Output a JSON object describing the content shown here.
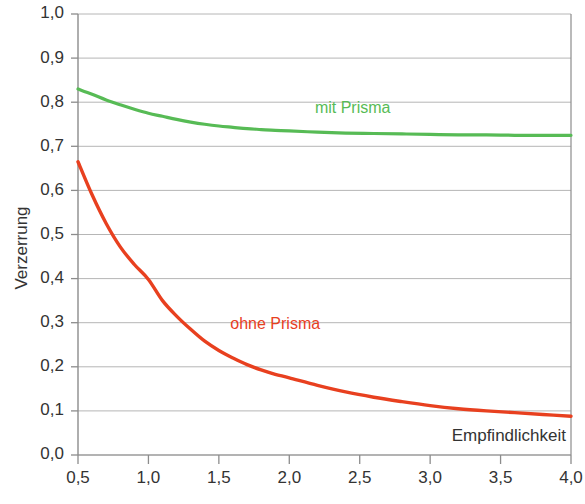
{
  "chart_data": {
    "type": "line",
    "title": "",
    "subtitle": "",
    "xlabel": "Empfindlichkeit",
    "ylabel": "Verzerrung",
    "xlim": [
      0.5,
      4.0
    ],
    "ylim": [
      0.0,
      1.0
    ],
    "xticks": [
      "0,5",
      "1,0",
      "1,5",
      "2,0",
      "2,5",
      "3,0",
      "3,5",
      "4,0"
    ],
    "xtick_values": [
      0.5,
      1.0,
      1.5,
      2.0,
      2.5,
      3.0,
      3.5,
      4.0
    ],
    "yticks": [
      "0,0",
      "0,1",
      "0,2",
      "0,3",
      "0,4",
      "0,5",
      "0,6",
      "0,7",
      "0,8",
      "0,9",
      "1,0"
    ],
    "ytick_values": [
      0.0,
      0.1,
      0.2,
      0.3,
      0.4,
      0.5,
      0.6,
      0.7,
      0.8,
      0.9,
      1.0
    ],
    "grid": true,
    "grid_axis": "y",
    "legend_position": "inline-annotation",
    "decimal_separator": ",",
    "series": [
      {
        "name": "mit Prisma",
        "color": "#57bb55",
        "label_x": 2.45,
        "label_y": 0.775,
        "x": [
          0.5,
          0.6,
          0.7,
          0.8,
          0.9,
          1.0,
          1.1,
          1.2,
          1.3,
          1.4,
          1.5,
          1.6,
          1.7,
          1.8,
          1.9,
          2.0,
          2.2,
          2.4,
          2.6,
          2.8,
          3.0,
          3.2,
          3.4,
          3.6,
          3.8,
          4.0
        ],
        "values": [
          0.83,
          0.818,
          0.805,
          0.794,
          0.784,
          0.775,
          0.768,
          0.761,
          0.755,
          0.75,
          0.746,
          0.743,
          0.74,
          0.738,
          0.736,
          0.735,
          0.732,
          0.73,
          0.729,
          0.728,
          0.727,
          0.726,
          0.726,
          0.725,
          0.725,
          0.725
        ]
      },
      {
        "name": "ohne Prisma",
        "color": "#e8401f",
        "label_x": 1.9,
        "label_y": 0.285,
        "x": [
          0.5,
          0.6,
          0.7,
          0.8,
          0.9,
          1.0,
          1.1,
          1.2,
          1.3,
          1.4,
          1.5,
          1.6,
          1.7,
          1.8,
          1.9,
          2.0,
          2.2,
          2.4,
          2.6,
          2.8,
          3.0,
          3.2,
          3.4,
          3.6,
          3.8,
          4.0
        ],
        "values": [
          0.665,
          0.59,
          0.525,
          0.472,
          0.432,
          0.398,
          0.35,
          0.315,
          0.285,
          0.258,
          0.237,
          0.22,
          0.205,
          0.193,
          0.183,
          0.175,
          0.158,
          0.143,
          0.131,
          0.121,
          0.112,
          0.105,
          0.1,
          0.096,
          0.092,
          0.088
        ]
      }
    ]
  },
  "axes": {
    "y_title": "Verzerrung",
    "x_title": "Empfindlichkeit"
  },
  "colors": {
    "green_series": "#57bb55",
    "red_series": "#e8401f",
    "grid": "#b6b6b6",
    "axis": "#8c8c8c",
    "tick_text": "#333333",
    "background": "#ffffff"
  }
}
